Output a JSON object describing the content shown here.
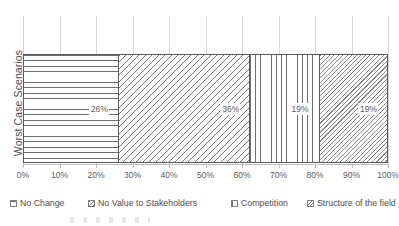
{
  "chart_data": {
    "type": "bar",
    "orientation": "horizontal",
    "stacked": true,
    "normalized": "100%",
    "title": "",
    "xlabel": "",
    "ylabel": "Worst Case Scenarios",
    "categories": [
      "Worst Case Scenarios"
    ],
    "xlim": [
      0,
      100
    ],
    "grid": true,
    "legend_position": "bottom",
    "tick_labels": [
      "0%",
      "10%",
      "20%",
      "30%",
      "40%",
      "50%",
      "60%",
      "70%",
      "80%",
      "90%",
      "100%"
    ],
    "tick_values": [
      0,
      10,
      20,
      30,
      40,
      50,
      60,
      70,
      80,
      90,
      100
    ],
    "series": [
      {
        "name": "No Change",
        "value": 26,
        "data_label": "26%",
        "pattern": "horizontal-lines",
        "swatch": "sw-horizontal",
        "fill": "pat-horizontal"
      },
      {
        "name": "No Value to Stakeholders",
        "value": 36,
        "data_label": "36%",
        "pattern": "diagonal-lines-wide",
        "swatch": "sw-diag-wide",
        "fill": "pat-diag-wide"
      },
      {
        "name": "Competition",
        "value": 19,
        "data_label": "19%",
        "pattern": "vertical-lines",
        "swatch": "sw-vertical",
        "fill": "pat-vertical"
      },
      {
        "name": "Structure of the field",
        "value": 19,
        "data_label": "19%",
        "pattern": "diagonal-lines-fine",
        "swatch": "sw-diag-fine",
        "fill": "pat-diag-fine"
      }
    ],
    "colors": {
      "gridline": "#d9d9d9",
      "axis": "#bfbfbf",
      "bar_outline": "#5a5a5a",
      "text": "#595959",
      "background": "#ffffff"
    }
  }
}
